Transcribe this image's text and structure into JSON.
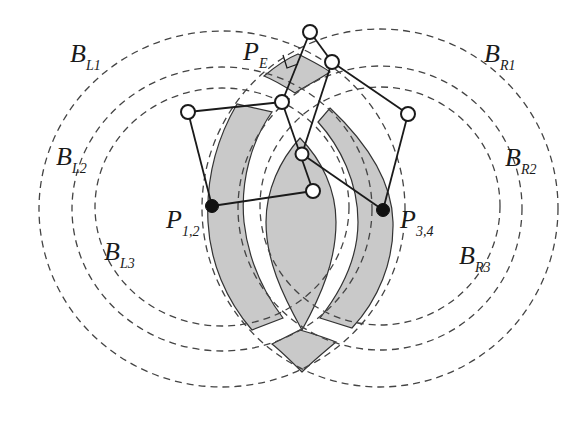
{
  "diagram": {
    "labels": {
      "BL1": {
        "main": "B",
        "sub": "L1"
      },
      "BL2": {
        "main": "B",
        "sub": "L2"
      },
      "BL3": {
        "main": "B",
        "sub": "L3"
      },
      "BR1": {
        "main": "B",
        "sub": "R1"
      },
      "BR2": {
        "main": "B",
        "sub": "R2"
      },
      "BR3": {
        "main": "B",
        "sub": "R3"
      },
      "PE": {
        "main": "P",
        "sub": "E"
      },
      "P12": {
        "main": "P",
        "sub": "1,2"
      },
      "P34": {
        "main": "P",
        "sub": "3,4"
      }
    },
    "colors": {
      "shaded_band": "#c9c9c9",
      "stroke": "#1a1a1a",
      "dashed": "#444444",
      "background": "#ffffff"
    },
    "boundaries_left": [
      "B_L1",
      "B_L2",
      "B_L3"
    ],
    "boundaries_right": [
      "B_R1",
      "B_R2",
      "B_R3"
    ],
    "nodes": {
      "open": 7,
      "filled": 2
    }
  }
}
